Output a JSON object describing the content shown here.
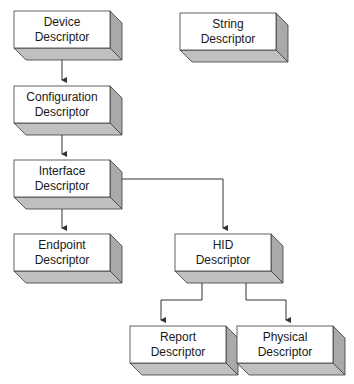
{
  "diagram": {
    "nodes": [
      {
        "id": "device",
        "line1": "Device",
        "line2": "Descriptor",
        "x": 14,
        "y": 11,
        "w": 96,
        "h": 37
      },
      {
        "id": "string",
        "line1": "String",
        "line2": "Descriptor",
        "x": 180,
        "y": 13,
        "w": 96,
        "h": 37
      },
      {
        "id": "configuration",
        "line1": "Configuration",
        "line2": "Descriptor",
        "x": 14,
        "y": 86,
        "w": 96,
        "h": 37
      },
      {
        "id": "interface",
        "line1": "Interface",
        "line2": "Descriptor",
        "x": 14,
        "y": 160,
        "w": 96,
        "h": 37
      },
      {
        "id": "endpoint",
        "line1": "Endpoint",
        "line2": "Descriptor",
        "x": 14,
        "y": 234,
        "w": 96,
        "h": 37
      },
      {
        "id": "hid",
        "line1": "HID",
        "line2": "Descriptor",
        "x": 175,
        "y": 234,
        "w": 96,
        "h": 37
      },
      {
        "id": "report",
        "line1": "Report",
        "line2": "Descriptor",
        "x": 130,
        "y": 326,
        "w": 96,
        "h": 37
      },
      {
        "id": "physical",
        "line1": "Physical",
        "line2": "Descriptor",
        "x": 237,
        "y": 326,
        "w": 96,
        "h": 37
      }
    ],
    "edges": [
      {
        "from": "device",
        "to": "configuration"
      },
      {
        "from": "configuration",
        "to": "interface"
      },
      {
        "from": "interface",
        "to": "endpoint"
      },
      {
        "from": "interface",
        "to": "hid"
      },
      {
        "from": "hid",
        "to": "report"
      },
      {
        "from": "hid",
        "to": "physical"
      }
    ],
    "colors": {
      "face": "#ffffff",
      "side": "#a9a9a9",
      "bottom": "#c0c0c0",
      "stroke": "#3a3a3a",
      "connector": "#333333"
    }
  }
}
